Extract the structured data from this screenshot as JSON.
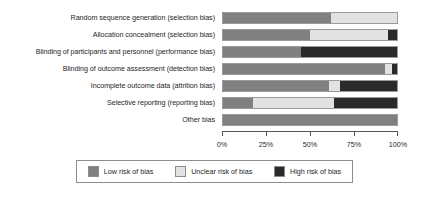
{
  "chart_data": {
    "type": "bar",
    "orientation": "horizontal",
    "stacked": true,
    "normalized_percent": true,
    "title": "",
    "subtitle": "",
    "xlabel": "",
    "ylabel": "",
    "xlim": [
      0,
      100
    ],
    "grid": false,
    "legend_position": "bottom",
    "categories": [
      "Random sequence generation (selection bias)",
      "Allocation concealment (selection bias)",
      "Blinding of participants and personnel (performance bias)",
      "Blinding of outcome assessment (detection bias)",
      "Incomplete outcome data (attrition bias)",
      "Selective reporting (reporting bias)",
      "Other bias"
    ],
    "series": [
      {
        "name": "Low risk of bias",
        "color": "#808080",
        "values": [
          62,
          50,
          45,
          93,
          61,
          17,
          100
        ]
      },
      {
        "name": "Unclear risk of bias",
        "color": "#e2e2e2",
        "values": [
          38,
          45,
          0,
          4,
          6,
          47,
          0
        ]
      },
      {
        "name": "High risk of bias",
        "color": "#2a2a2a",
        "values": [
          0,
          5,
          55,
          3,
          33,
          36,
          0
        ]
      }
    ],
    "xticks": [
      0,
      25,
      50,
      75,
      100
    ],
    "xticklabels": [
      "0%",
      "25%",
      "50%",
      "75%",
      "100%"
    ],
    "legend_entries": [
      {
        "label": "Low risk of bias",
        "color": "#808080"
      },
      {
        "label": "Unclear risk of bias",
        "color": "#e2e2e2"
      },
      {
        "label": "High risk of bias",
        "color": "#2a2a2a"
      }
    ]
  },
  "colors": {
    "low_risk": "#808080",
    "unclear_risk": "#e2e2e2",
    "high_risk": "#2a2a2a",
    "axis": "#555555",
    "bar_border": "#9a9a9a",
    "legend_border": "#8d8d8d",
    "background": "#ffffff",
    "text": "#1f1f1f"
  }
}
